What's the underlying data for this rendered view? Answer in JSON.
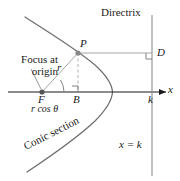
{
  "figure": {
    "title_text": "Directrix",
    "labels": {
      "directrix": "Directrix",
      "focus_at_origin": "Focus at\norigin",
      "point_P": "P",
      "point_D": "D",
      "point_F": "F",
      "point_B": "B",
      "segment_r": "r",
      "segment_r_cos_theta": "r cos θ",
      "axis_x": "x",
      "tick_k": "k",
      "directrix_equation": "x = k",
      "curve_name": "Conic section"
    },
    "colors": {
      "background": "#ffffff",
      "curve": "#6e6e6e",
      "axis": "#1a1a1a",
      "helper_line": "#9a9a9a",
      "dashed_line": "#a8a8a8",
      "directrix_line": "#8f8f8f",
      "text": "#1a1a1a",
      "point_fill": "#555555"
    },
    "geometry": {
      "focus_point": [
        42,
        92
      ],
      "point_P": [
        78,
        53
      ],
      "point_B": [
        78,
        92
      ],
      "point_D": [
        152,
        53
      ],
      "vertex_x": 112,
      "directrix_x": 152,
      "axis_y": 92
    }
  }
}
